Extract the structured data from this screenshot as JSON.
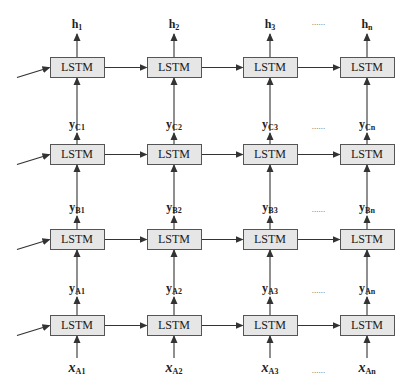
{
  "diagram": {
    "type": "stacked-lstm",
    "cell_label": "LSTM",
    "ellipsis": "......",
    "columns_x": [
      77,
      174,
      270,
      367
    ],
    "layers": [
      {
        "id": "C",
        "box_y": 57,
        "inputs": [
          "y_C1",
          "y_C2",
          "y_C3",
          "y_Cn"
        ],
        "outputs": [
          "h_1",
          "h_2",
          "h_3",
          "h_n"
        ]
      },
      {
        "id": "B",
        "box_y": 144,
        "inputs": [
          "y_B1",
          "y_B2",
          "y_B3",
          "y_Bn"
        ]
      },
      {
        "id": "A2",
        "box_y": 229,
        "inputs": [
          "y_A1",
          "y_A2",
          "y_A3",
          "y_An"
        ]
      },
      {
        "id": "A1",
        "box_y": 315,
        "inputs": [
          "x_A1",
          "x_A2",
          "x_A3",
          "x_An"
        ]
      }
    ],
    "labels": {
      "h": [
        {
          "base": "h",
          "sub": "1"
        },
        {
          "base": "h",
          "sub": "2"
        },
        {
          "base": "h",
          "sub": "3"
        },
        {
          "base": "h",
          "sub": "n"
        }
      ],
      "yC": [
        {
          "base": "y",
          "sub": "C1"
        },
        {
          "base": "y",
          "sub": "C2"
        },
        {
          "base": "y",
          "sub": "C3"
        },
        {
          "base": "y",
          "sub": "Cn"
        }
      ],
      "yB": [
        {
          "base": "y",
          "sub": "B1"
        },
        {
          "base": "y",
          "sub": "B2"
        },
        {
          "base": "y",
          "sub": "B3"
        },
        {
          "base": "y",
          "sub": "Bn"
        }
      ],
      "yA": [
        {
          "base": "y",
          "sub": "A1"
        },
        {
          "base": "y",
          "sub": "A2"
        },
        {
          "base": "y",
          "sub": "A3"
        },
        {
          "base": "y",
          "sub": "An"
        }
      ],
      "xA": [
        {
          "base": "x",
          "sub": "A1"
        },
        {
          "base": "x",
          "sub": "A2"
        },
        {
          "base": "x",
          "sub": "A3"
        },
        {
          "base": "x",
          "sub": "An"
        }
      ]
    },
    "colors": {
      "box_fill": "#e6e6e6",
      "box_border": "#555555",
      "arrow": "#333333",
      "text": "#222222"
    }
  }
}
